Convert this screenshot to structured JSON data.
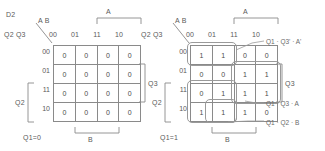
{
  "figure": {
    "title_label": "D2",
    "chart_data": {
      "type": "table",
      "title": "D2 Karnaugh maps",
      "description": "Two 4x4 Karnaugh maps for next-state D2, split on Q1=0 and Q1=1",
      "col_var_label": "A B",
      "row_var_label": "Q2 Q3",
      "col_headers": [
        "00",
        "01",
        "11",
        "10"
      ],
      "row_headers": [
        "00",
        "01",
        "11",
        "10"
      ],
      "maps": [
        {
          "name": "Q1=0",
          "caption": "Q1=0",
          "values": [
            [
              "0",
              "0",
              "0",
              "0"
            ],
            [
              "0",
              "0",
              "0",
              "0"
            ],
            [
              "0",
              "0",
              "0",
              "0"
            ],
            [
              "0",
              "0",
              "0",
              "0"
            ]
          ],
          "groups": []
        },
        {
          "name": "Q1=1",
          "caption": "Q1=1",
          "values": [
            [
              "1",
              "1",
              "0",
              "0"
            ],
            [
              "0",
              "0",
              "1",
              "1"
            ],
            [
              "0",
              "1",
              "1",
              "1"
            ],
            [
              "1",
              "1",
              "1",
              "0"
            ]
          ],
          "groups": [
            {
              "term": "Q1 · Q3' · A'"
            },
            {
              "term": "Q1 · Q3 · A"
            },
            {
              "term": "Q1 · Q2 · B"
            }
          ]
        }
      ],
      "brackets": {
        "top": "A",
        "right": "Q3",
        "left": "Q2",
        "bottom": "B"
      }
    }
  },
  "map_left": {
    "caption": "Q1=0",
    "col_var": "A B",
    "row_var": "Q2 Q3",
    "cols": [
      "00",
      "01",
      "11",
      "10"
    ],
    "rows": [
      "00",
      "01",
      "11",
      "10"
    ],
    "cells": [
      "0",
      "0",
      "0",
      "0",
      "0",
      "0",
      "0",
      "0",
      "0",
      "0",
      "0",
      "0",
      "0",
      "0",
      "0",
      "0"
    ],
    "bracket_a": "A",
    "bracket_q3": "Q3",
    "bracket_q2": "Q2",
    "bracket_b": "B"
  },
  "map_right": {
    "caption": "Q1=1",
    "col_var": "A B",
    "row_var": "Q2 Q3",
    "cols": [
      "00",
      "01",
      "11",
      "10"
    ],
    "rows": [
      "00",
      "01",
      "11",
      "10"
    ],
    "cells": [
      "1",
      "1",
      "0",
      "0",
      "0",
      "0",
      "1",
      "1",
      "0",
      "1",
      "1",
      "1",
      "1",
      "1",
      "1",
      "0"
    ],
    "bracket_a": "A",
    "bracket_q3": "Q3",
    "bracket_q2": "Q2",
    "bracket_b": "B",
    "annotations": [
      "Q1 · Q3' · A'",
      "Q1 · Q3 · A",
      "Q1 · Q2 · B"
    ]
  },
  "colors": {
    "ink": "#4a4a4a",
    "rule": "#8a8a8a",
    "group": "#9a9a9a",
    "background": "#ffffff"
  }
}
